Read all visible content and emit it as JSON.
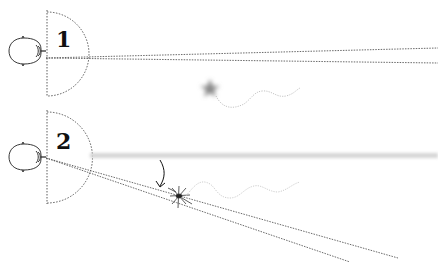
{
  "diagram": {
    "type": "gaze-direction-illustration",
    "panels": [
      {
        "label": "1",
        "description": "Observer looks straight ahead; moving insect in peripheral vision appears blurred",
        "gaze": "straight",
        "insect_state": "blurred"
      },
      {
        "label": "2",
        "description": "Observer turns gaze toward insect (arrow); insect appears sharp within line of sight",
        "gaze": "angled-down-right",
        "insect_state": "sharp"
      }
    ],
    "colors": {
      "line": "#333333",
      "blur": "#9a9a9a",
      "trail": "#b5b5b5",
      "ink": "#111111"
    }
  }
}
